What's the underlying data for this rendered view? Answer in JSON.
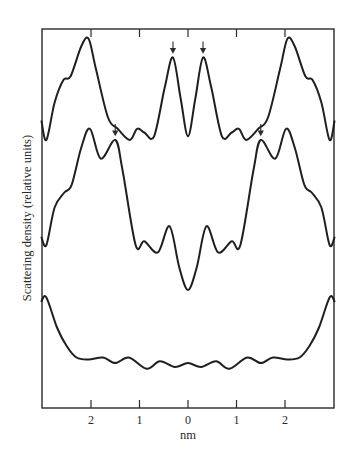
{
  "chart_data": {
    "type": "line",
    "title": "",
    "xlabel": "nm",
    "ylabel": "Scattering density (relative units)",
    "xlim": [
      -3.02,
      3.02
    ],
    "x_ticks": [
      -2,
      -1,
      0,
      1,
      2
    ],
    "x_tick_labels": [
      "2",
      "1",
      "0",
      "1",
      "2"
    ],
    "y_ticks_shown": false,
    "grid": false,
    "legend": "none",
    "ylim": [
      0,
      1
    ],
    "series": [
      {
        "name": "top profile",
        "arrows_at_x": [
          -0.31,
          0.31
        ],
        "points": [
          [
            -3.02,
            0.77
          ],
          [
            -2.92,
            0.72
          ],
          [
            -2.75,
            0.82
          ],
          [
            -2.57,
            0.88
          ],
          [
            -2.42,
            0.89
          ],
          [
            -2.2,
            0.97
          ],
          [
            -2.05,
            0.99
          ],
          [
            -1.9,
            0.91
          ],
          [
            -1.65,
            0.78
          ],
          [
            -1.45,
            0.75
          ],
          [
            -1.2,
            0.72
          ],
          [
            -1.05,
            0.75
          ],
          [
            -0.9,
            0.74
          ],
          [
            -0.7,
            0.73
          ],
          [
            -0.48,
            0.86
          ],
          [
            -0.31,
            0.94
          ],
          [
            -0.15,
            0.83
          ],
          [
            0.0,
            0.73
          ],
          [
            0.15,
            0.83
          ],
          [
            0.31,
            0.94
          ],
          [
            0.48,
            0.86
          ],
          [
            0.7,
            0.73
          ],
          [
            0.9,
            0.74
          ],
          [
            1.05,
            0.75
          ],
          [
            1.2,
            0.72
          ],
          [
            1.45,
            0.75
          ],
          [
            1.65,
            0.78
          ],
          [
            1.9,
            0.91
          ],
          [
            2.05,
            0.99
          ],
          [
            2.2,
            0.97
          ],
          [
            2.42,
            0.89
          ],
          [
            2.57,
            0.88
          ],
          [
            2.75,
            0.82
          ],
          [
            2.92,
            0.72
          ],
          [
            3.02,
            0.77
          ]
        ]
      },
      {
        "name": "middle profile",
        "arrows_at_x": [
          -1.5,
          1.5
        ],
        "points": [
          [
            -3.02,
            0.46
          ],
          [
            -2.92,
            0.44
          ],
          [
            -2.75,
            0.54
          ],
          [
            -2.55,
            0.58
          ],
          [
            -2.4,
            0.6
          ],
          [
            -2.2,
            0.7
          ],
          [
            -2.02,
            0.75
          ],
          [
            -1.8,
            0.67
          ],
          [
            -1.5,
            0.72
          ],
          [
            -1.35,
            0.64
          ],
          [
            -1.08,
            0.44
          ],
          [
            -0.9,
            0.45
          ],
          [
            -0.62,
            0.42
          ],
          [
            -0.38,
            0.49
          ],
          [
            -0.18,
            0.38
          ],
          [
            0.0,
            0.32
          ],
          [
            0.18,
            0.38
          ],
          [
            0.38,
            0.49
          ],
          [
            0.62,
            0.42
          ],
          [
            0.9,
            0.45
          ],
          [
            1.08,
            0.44
          ],
          [
            1.35,
            0.64
          ],
          [
            1.5,
            0.72
          ],
          [
            1.8,
            0.67
          ],
          [
            2.02,
            0.75
          ],
          [
            2.2,
            0.7
          ],
          [
            2.4,
            0.6
          ],
          [
            2.55,
            0.58
          ],
          [
            2.75,
            0.54
          ],
          [
            2.92,
            0.44
          ],
          [
            3.02,
            0.46
          ]
        ]
      },
      {
        "name": "bottom profile",
        "arrows_at_x": [],
        "points": [
          [
            -3.02,
            0.29
          ],
          [
            -2.92,
            0.3
          ],
          [
            -2.7,
            0.22
          ],
          [
            -2.5,
            0.17
          ],
          [
            -2.3,
            0.14
          ],
          [
            -2.05,
            0.135
          ],
          [
            -1.75,
            0.14
          ],
          [
            -1.5,
            0.125
          ],
          [
            -1.22,
            0.14
          ],
          [
            -0.85,
            0.11
          ],
          [
            -0.58,
            0.13
          ],
          [
            -0.27,
            0.115
          ],
          [
            0.0,
            0.125
          ],
          [
            0.27,
            0.115
          ],
          [
            0.58,
            0.13
          ],
          [
            0.85,
            0.11
          ],
          [
            1.22,
            0.14
          ],
          [
            1.5,
            0.125
          ],
          [
            1.75,
            0.14
          ],
          [
            2.05,
            0.135
          ],
          [
            2.3,
            0.14
          ],
          [
            2.5,
            0.17
          ],
          [
            2.7,
            0.22
          ],
          [
            2.92,
            0.3
          ],
          [
            3.02,
            0.29
          ]
        ]
      }
    ]
  }
}
